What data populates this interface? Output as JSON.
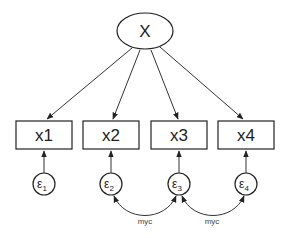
{
  "latent": {
    "label": "X"
  },
  "observed": [
    {
      "label": "x1",
      "error": "ε",
      "error_sub": "1"
    },
    {
      "label": "x2",
      "error": "ε",
      "error_sub": "2"
    },
    {
      "label": "x3",
      "error": "ε",
      "error_sub": "3"
    },
    {
      "label": "x4",
      "error": "ε",
      "error_sub": "4"
    }
  ],
  "covariances": [
    {
      "from": "ε2",
      "to": "ε3",
      "label": "myc"
    },
    {
      "from": "ε3",
      "to": "ε4",
      "label": "myc"
    }
  ]
}
